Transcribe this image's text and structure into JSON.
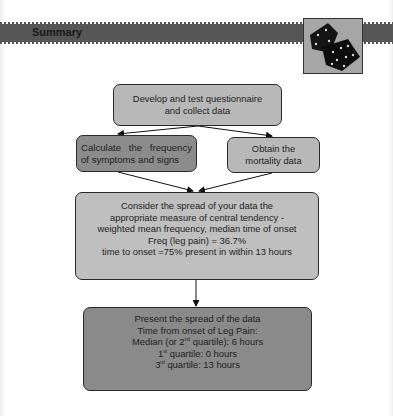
{
  "header": {
    "title": "Summary",
    "image": "dice-image"
  },
  "flowchart": {
    "nodes": [
      {
        "id": "develop",
        "text": "Develop and test questionnaire\nand collect data"
      },
      {
        "id": "calculate",
        "text": "Calculate the frequency of symptoms and signs"
      },
      {
        "id": "obtain",
        "text": "Obtain the\nmortality data"
      },
      {
        "id": "consider",
        "lines": [
          "Consider the spread of your data the",
          "appropriate measure of central tendency -",
          "weighted mean frequency, median time of onset",
          "Freq (leg pain) = 36.7%",
          "time to onset  =75% present in within 13 hours"
        ]
      },
      {
        "id": "present",
        "lines": [
          "Present the spread of the data",
          "Time from onset of Leg Pain:"
        ],
        "median": {
          "pre": "Median (or 2",
          "sup": "nd",
          "post": " quartile): 6 hours"
        },
        "q1": {
          "pre": "1",
          "sup": "st",
          "post": " quartile: 0 hours"
        },
        "q3": {
          "pre": "3",
          "sup": "rd",
          "post": " quartile: 13 hours"
        }
      }
    ],
    "edges": [
      {
        "from": "develop",
        "to": "calculate"
      },
      {
        "from": "develop",
        "to": "obtain"
      },
      {
        "from": "calculate",
        "to": "consider"
      },
      {
        "from": "obtain",
        "to": "consider"
      },
      {
        "from": "consider",
        "to": "present"
      }
    ]
  },
  "colors": {
    "banner": "#565656",
    "box_light": "#b8b8b8",
    "box_dark": "#8a8a8a",
    "border": "#2a2a2a"
  }
}
